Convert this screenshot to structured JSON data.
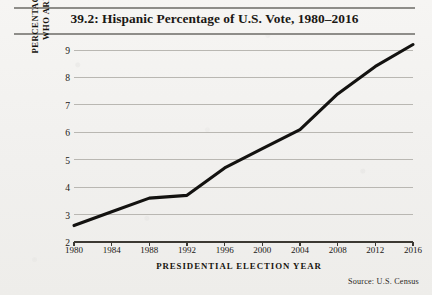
{
  "figure": {
    "title": "39.2: Hispanic Percentage of U.S. Vote, 1980–2016",
    "source_note": "Source:  U.S. Census",
    "y_axis_title_line1": "PERCENTAGE OF VOTERS",
    "y_axis_title_line2": "WHO ARE HISPANIC",
    "x_axis_title": "PRESIDENTIAL ELECTION YEAR",
    "line_color": "#131210",
    "grid_color": "#b9b7b2",
    "page_color": "#f2f1ef"
  },
  "chart_data": {
    "type": "line",
    "title": "39.2: Hispanic Percentage of U.S. Vote, 1980–2016",
    "xlabel": "PRESIDENTIAL ELECTION YEAR",
    "ylabel": "PERCENTAGE OF VOTERS WHO ARE HISPANIC",
    "x": [
      1980,
      1984,
      1988,
      1992,
      1996,
      2000,
      2004,
      2008,
      2012,
      2016
    ],
    "values": [
      2.6,
      3.1,
      3.6,
      3.7,
      4.7,
      5.4,
      6.1,
      7.4,
      8.4,
      9.2
    ],
    "xtick_labels": [
      "1980",
      "1984",
      "1988",
      "1992",
      "1996",
      "2000",
      "2004",
      "2008",
      "2012",
      "2016"
    ],
    "ytick_labels": [
      "2",
      "3",
      "4",
      "5",
      "6",
      "7",
      "8",
      "9"
    ],
    "ytick_values": [
      2,
      3,
      4,
      5,
      6,
      7,
      8,
      9
    ],
    "xlim": [
      1980,
      2016
    ],
    "ylim": [
      2,
      9
    ],
    "grid": true,
    "grid_axis": "y",
    "legend": "none",
    "annotations": [
      "Source:  U.S. Census"
    ]
  }
}
